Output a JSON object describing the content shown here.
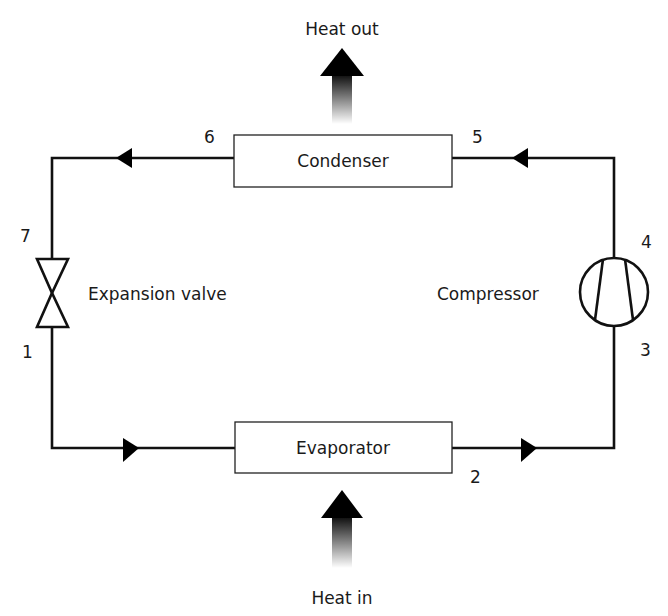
{
  "diagram": {
    "type": "refrigeration-cycle",
    "heat_out_label": "Heat out",
    "heat_in_label": "Heat in",
    "components": {
      "condenser": "Condenser",
      "evaporator": "Evaporator",
      "expansion_valve": "Expansion valve",
      "compressor": "Compressor"
    },
    "state_points": [
      "1",
      "2",
      "3",
      "4",
      "5",
      "6",
      "7"
    ],
    "flow_direction": "clockwise: evaporator → compressor → condenser → expansion valve",
    "colors": {
      "line": "#111111",
      "text": "#1a1a1a",
      "background": "#ffffff"
    }
  }
}
